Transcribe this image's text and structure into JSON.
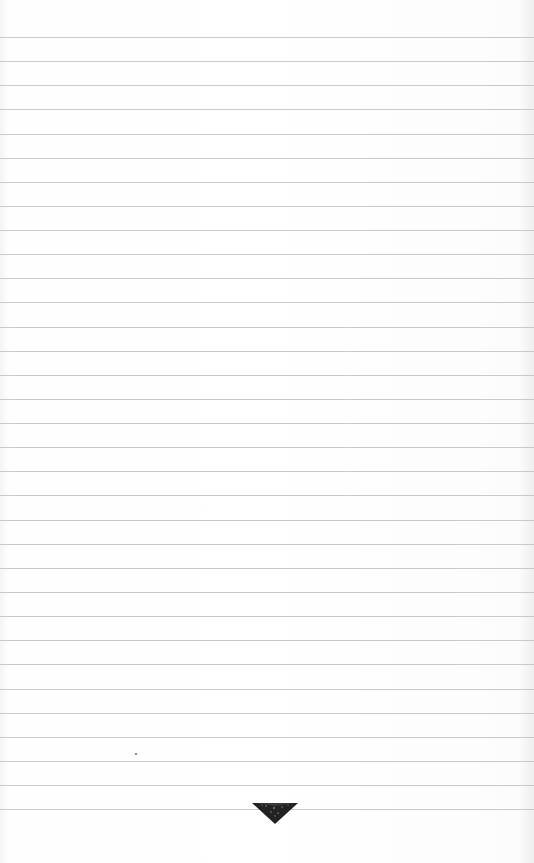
{
  "page": {
    "type": "ruled-notebook-page",
    "background_color": "#fdfdfd",
    "rule_color": "#c9c9c9",
    "bleed_through_text": [
      "",
      ""
    ],
    "rules": {
      "count": 33,
      "first_y": 37,
      "spacing": 24.13
    },
    "mark": {
      "x": 135,
      "y": 753,
      "color": "#6a6a6a"
    },
    "ornament": {
      "shape": "inverted-triangle",
      "color": "#222222"
    }
  }
}
